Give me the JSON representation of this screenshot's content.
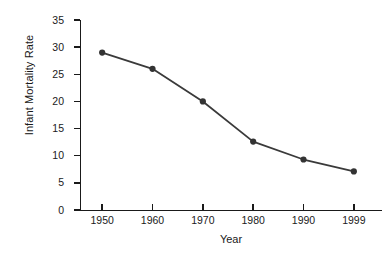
{
  "chart_data": {
    "type": "line",
    "title": "",
    "xlabel": "Year",
    "ylabel": "Infant Mortality Rate",
    "categories": [
      "1950",
      "1960",
      "1970",
      "1980",
      "1990",
      "1999"
    ],
    "values": [
      29.0,
      26.0,
      20.0,
      12.6,
      9.3,
      7.1
    ],
    "series": [
      {
        "name": "Infant Mortality Rate",
        "values": [
          29.0,
          26.0,
          20.0,
          12.6,
          9.3,
          7.1
        ]
      }
    ],
    "ylim": [
      0,
      35
    ],
    "yticks": [
      0,
      5,
      10,
      15,
      20,
      25,
      30,
      35
    ],
    "ytick_labels": [
      "0",
      "5",
      "10",
      "15",
      "20",
      "25",
      "30",
      "35"
    ],
    "xticks": [
      "1950",
      "1960",
      "1970",
      "1980",
      "1990",
      "1999"
    ],
    "grid": false,
    "legend": false,
    "legend_position": "none",
    "marker": "circle",
    "line_color": "#3a3a3a",
    "marker_color": "#333333",
    "axis_color": "#1a1a1a",
    "background_color": "#ffffff"
  }
}
